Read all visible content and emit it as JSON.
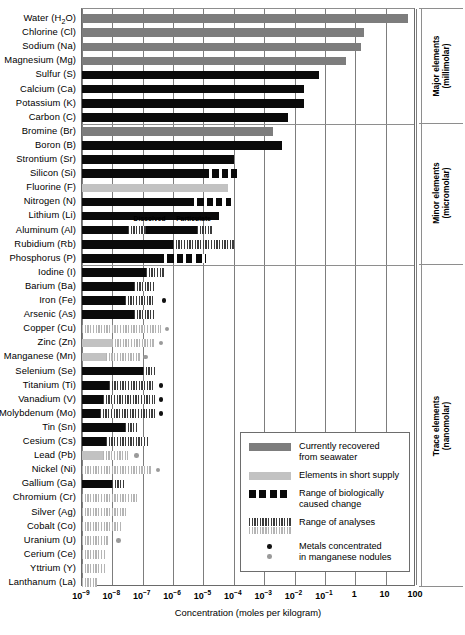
{
  "chart_data": {
    "type": "bar",
    "title": "",
    "xlabel": "Concentration (moles per kilogram)",
    "ylabel": "",
    "xscale": "log",
    "xlim": [
      -9,
      2
    ],
    "xticks": [
      "10⁻⁹",
      "10⁻⁸",
      "10⁻⁷",
      "10⁻⁶",
      "10⁻⁵",
      "10⁻⁴",
      "10⁻³",
      "10⁻²",
      "10⁻¹",
      "1",
      "10",
      "100"
    ],
    "xtick_exponents": [
      -9,
      -8,
      -7,
      -6,
      -5,
      -4,
      -3,
      -2,
      -1,
      0,
      1,
      2
    ],
    "grid": "vertical",
    "legend_position": "inside-lower-right",
    "categories": [
      "Water (H2O)",
      "Chlorine (Cl)",
      "Sodium (Na)",
      "Magnesium (Mg)",
      "Sulfur (S)",
      "Calcium (Ca)",
      "Potassium (K)",
      "Carbon (C)",
      "Bromine (Br)",
      "Boron (B)",
      "Strontium (Sr)",
      "Silicon (Si)",
      "Fluorine (F)",
      "Nitrogen (N)",
      "Lithium (Li)",
      "Aluminum (Al)",
      "Rubidium (Rb)",
      "Phosphorus (P)",
      "Iodine (I)",
      "Barium (Ba)",
      "Iron (Fe)",
      "Arsenic (As)",
      "Copper (Cu)",
      "Zinc (Zn)",
      "Manganese (Mn)",
      "Selenium (Se)",
      "Titanium (Ti)",
      "Vanadium (V)",
      "Molybdenum (Mo)",
      "Tin (Sn)",
      "Cesium (Cs)",
      "Lead (Pb)",
      "Nickel (Ni)",
      "Gallium (Ga)",
      "Chromium (Cr)",
      "Silver (Ag)",
      "Cobalt (Co)",
      "Uranium (U)",
      "Cerium (Ce)",
      "Yttrium (Y)",
      "Lanthanum (La)"
    ],
    "values_log10_max": [
      1.75,
      0.3,
      0.2,
      -0.3,
      -1.2,
      -1.7,
      -1.7,
      -2.2,
      -2.7,
      -2.4,
      -4.0,
      -4.0,
      -4.2,
      -4.1,
      -4.5,
      -4.0,
      -5.9,
      -4.9,
      -6.3,
      -6.6,
      -5.9,
      -6.6,
      -6.2,
      -6.1,
      -6.9,
      -6.0,
      -6.5,
      -6.5,
      -6.4,
      -6.1,
      -6.6,
      -6.3,
      -6.5,
      -7.3,
      -6.8,
      -7.0,
      -7.2,
      -7.5,
      -7.8,
      -7.7,
      -8.0
    ],
    "note_dissolved": "Dissolved",
    "note_particulate": "Particulate"
  },
  "rows": [
    {
      "name": "Water (H₂O)",
      "label_html": "Water (H<sub>2</sub>O)",
      "segments": [
        {
          "style": "gray",
          "from": -9,
          "to": 1.75
        }
      ],
      "dots": []
    },
    {
      "name": "Chlorine (Cl)",
      "label_html": "Chlorine (Cl)",
      "segments": [
        {
          "style": "gray",
          "from": -9,
          "to": 0.3
        }
      ],
      "dots": []
    },
    {
      "name": "Sodium (Na)",
      "label_html": "Sodium (Na)",
      "segments": [
        {
          "style": "gray",
          "from": -9,
          "to": 0.2
        }
      ],
      "dots": []
    },
    {
      "name": "Magnesium (Mg)",
      "label_html": "Magnesium (Mg)",
      "segments": [
        {
          "style": "gray",
          "from": -9,
          "to": -0.3
        }
      ],
      "dots": []
    },
    {
      "name": "Sulfur (S)",
      "label_html": "Sulfur (S)",
      "segments": [
        {
          "style": "dark",
          "from": -9,
          "to": -1.2
        }
      ],
      "dots": []
    },
    {
      "name": "Calcium (Ca)",
      "label_html": "Calcium (Ca)",
      "segments": [
        {
          "style": "dark",
          "from": -9,
          "to": -1.7
        }
      ],
      "dots": []
    },
    {
      "name": "Potassium (K)",
      "label_html": "Potassium (K)",
      "segments": [
        {
          "style": "dark",
          "from": -9,
          "to": -1.7
        }
      ],
      "dots": []
    },
    {
      "name": "Carbon (C)",
      "label_html": "Carbon (C)",
      "segments": [
        {
          "style": "dark",
          "from": -9,
          "to": -2.2
        }
      ],
      "dots": []
    },
    {
      "name": "Bromine (Br)",
      "label_html": "Bromine (Br)",
      "segments": [
        {
          "style": "gray",
          "from": -9,
          "to": -2.7
        }
      ],
      "dots": []
    },
    {
      "name": "Boron (B)",
      "label_html": "Boron (B)",
      "segments": [
        {
          "style": "dark",
          "from": -9,
          "to": -2.4
        }
      ],
      "dots": []
    },
    {
      "name": "Strontium (Sr)",
      "label_html": "Strontium (Sr)",
      "segments": [
        {
          "style": "dark",
          "from": -9,
          "to": -4.0
        }
      ],
      "dots": []
    },
    {
      "name": "Silicon (Si)",
      "label_html": "Silicon (Si)",
      "segments": [
        {
          "style": "dark",
          "from": -9,
          "to": -5.0
        },
        {
          "style": "bio",
          "from": -5.0,
          "to": -3.9
        }
      ],
      "dots": []
    },
    {
      "name": "Fluorine (F)",
      "label_html": "Fluorine (F)",
      "segments": [
        {
          "style": "light",
          "from": -9,
          "to": -4.2
        }
      ],
      "dots": []
    },
    {
      "name": "Nitrogen (N)",
      "label_html": "Nitrogen (N)",
      "segments": [
        {
          "style": "dark",
          "from": -9,
          "to": -5.5
        },
        {
          "style": "bio",
          "from": -5.5,
          "to": -4.1
        }
      ],
      "dots": []
    },
    {
      "name": "Lithium (Li)",
      "label_html": "Lithium (Li)",
      "segments": [
        {
          "style": "dark",
          "from": -9,
          "to": -4.5
        }
      ],
      "dots": []
    },
    {
      "name": "Aluminum (Al)",
      "label_html": "Aluminum (Al)",
      "segments": [
        {
          "style": "dark",
          "from": -9,
          "to": -7.5
        },
        {
          "style": "hatch-dark",
          "from": -7.5,
          "to": -6.9
        },
        {
          "style": "dark",
          "from": -6.9,
          "to": -5.2
        },
        {
          "style": "hatch-dark",
          "from": -5.2,
          "to": -4.7
        }
      ],
      "dots": []
    },
    {
      "name": "Rubidium (Rb)",
      "label_html": "Rubidium (Rb)",
      "segments": [
        {
          "style": "dark",
          "from": -9,
          "to": -6.0
        },
        {
          "style": "hatch-dark",
          "from": -6.0,
          "to": -4.0
        }
      ],
      "dots": []
    },
    {
      "name": "Phosphorus (P)",
      "label_html": "Phosphorus (P)",
      "segments": [
        {
          "style": "dark",
          "from": -9,
          "to": -6.5
        },
        {
          "style": "bio",
          "from": -6.5,
          "to": -4.9
        }
      ],
      "dots": []
    },
    {
      "name": "Iodine (I)",
      "label_html": "Iodine (I)",
      "segments": [
        {
          "style": "dark",
          "from": -9,
          "to": -6.9
        },
        {
          "style": "hatch-dark",
          "from": -6.9,
          "to": -6.3
        }
      ],
      "dots": []
    },
    {
      "name": "Barium (Ba)",
      "label_html": "Barium (Ba)",
      "segments": [
        {
          "style": "dark",
          "from": -9,
          "to": -7.3
        },
        {
          "style": "hatch-dark",
          "from": -7.3,
          "to": -6.6
        }
      ],
      "dots": []
    },
    {
      "name": "Iron (Fe)",
      "label_html": "Iron (Fe)",
      "segments": [
        {
          "style": "dark",
          "from": -9,
          "to": -7.6
        },
        {
          "style": "hatch-dark",
          "from": -7.6,
          "to": -6.6
        }
      ],
      "dots": [
        {
          "style": "dark",
          "at": -6.3
        }
      ]
    },
    {
      "name": "Arsenic (As)",
      "label_html": "Arsenic (As)",
      "segments": [
        {
          "style": "dark",
          "from": -9,
          "to": -7.3
        },
        {
          "style": "hatch-dark",
          "from": -7.3,
          "to": -6.6
        }
      ],
      "dots": []
    },
    {
      "name": "Copper (Cu)",
      "label_html": "Copper (Cu)",
      "segments": [
        {
          "style": "hatch-light",
          "from": -9,
          "to": -6.4
        }
      ],
      "dots": [
        {
          "style": "gray",
          "at": -6.2
        }
      ]
    },
    {
      "name": "Zinc (Zn)",
      "label_html": "Zinc (Zn)",
      "segments": [
        {
          "style": "light",
          "from": -9,
          "to": -8.0
        },
        {
          "style": "hatch-light",
          "from": -8.0,
          "to": -6.6
        }
      ],
      "dots": [
        {
          "style": "gray",
          "at": -6.4
        }
      ]
    },
    {
      "name": "Manganese (Mn)",
      "label_html": "Manganese (Mn)",
      "segments": [
        {
          "style": "light",
          "from": -9,
          "to": -8.2
        },
        {
          "style": "hatch-light",
          "from": -8.2,
          "to": -7.1
        }
      ],
      "dots": [
        {
          "style": "gray",
          "at": -6.9
        }
      ]
    },
    {
      "name": "Selenium (Se)",
      "label_html": "Selenium (Se)",
      "segments": [
        {
          "style": "dark",
          "from": -9,
          "to": -7.0
        },
        {
          "style": "hatch-dark",
          "from": -7.0,
          "to": -6.6
        }
      ],
      "dots": []
    },
    {
      "name": "Titanium (Ti)",
      "label_html": "Titanium (Ti)",
      "segments": [
        {
          "style": "dark",
          "from": -9,
          "to": -8.1
        },
        {
          "style": "hatch-dark",
          "from": -8.1,
          "to": -6.6
        }
      ],
      "dots": [
        {
          "style": "dark",
          "at": -6.4
        }
      ]
    },
    {
      "name": "Vanadium (V)",
      "label_html": "Vanadium (V)",
      "segments": [
        {
          "style": "dark",
          "from": -9,
          "to": -8.3
        },
        {
          "style": "hatch-dark",
          "from": -8.3,
          "to": -6.6
        }
      ],
      "dots": [
        {
          "style": "dark",
          "at": -6.4
        }
      ]
    },
    {
      "name": "Molybdenum (Mo)",
      "label_html": "Molybdenum (Mo)",
      "segments": [
        {
          "style": "dark",
          "from": -9,
          "to": -8.4
        },
        {
          "style": "hatch-dark",
          "from": -8.4,
          "to": -6.6
        }
      ],
      "dots": [
        {
          "style": "dark",
          "at": -6.4
        }
      ]
    },
    {
      "name": "Tin (Sn)",
      "label_html": "Tin (Sn)",
      "segments": [
        {
          "style": "dark",
          "from": -9,
          "to": -7.6
        },
        {
          "style": "hatch-dark",
          "from": -7.6,
          "to": -7.2
        }
      ],
      "dots": []
    },
    {
      "name": "Cesium (Cs)",
      "label_html": "Cesium (Cs)",
      "segments": [
        {
          "style": "dark",
          "from": -9,
          "to": -8.2
        },
        {
          "style": "hatch-dark",
          "from": -8.2,
          "to": -6.8
        }
      ],
      "dots": []
    },
    {
      "name": "Lead (Pb)",
      "label_html": "Lead (Pb)",
      "segments": [
        {
          "style": "light",
          "from": -9,
          "to": -8.3
        },
        {
          "style": "hatch-light",
          "from": -8.3,
          "to": -7.5
        }
      ],
      "dots": [
        {
          "style": "gray",
          "at": -7.2
        }
      ]
    },
    {
      "name": "Nickel (Ni)",
      "label_html": "Nickel (Ni)",
      "segments": [
        {
          "style": "hatch-light",
          "from": -9,
          "to": -6.7
        }
      ],
      "dots": [
        {
          "style": "gray",
          "at": -6.5
        }
      ]
    },
    {
      "name": "Gallium (Ga)",
      "label_html": "Gallium (Ga)",
      "segments": [
        {
          "style": "dark",
          "from": -9,
          "to": -8.0
        },
        {
          "style": "hatch-dark",
          "from": -8.0,
          "to": -7.6
        }
      ],
      "dots": []
    },
    {
      "name": "Chromium (Cr)",
      "label_html": "Chromium (Cr)",
      "segments": [
        {
          "style": "hatch-light",
          "from": -9,
          "to": -7.2
        }
      ],
      "dots": []
    },
    {
      "name": "Silver (Ag)",
      "label_html": "Silver (Ag)",
      "segments": [
        {
          "style": "hatch-light",
          "from": -9,
          "to": -7.5
        }
      ],
      "dots": []
    },
    {
      "name": "Cobalt (Co)",
      "label_html": "Cobalt (Co)",
      "segments": [
        {
          "style": "hatch-light",
          "from": -9,
          "to": -7.7
        }
      ],
      "dots": []
    },
    {
      "name": "Uranium (U)",
      "label_html": "Uranium (U)",
      "segments": [
        {
          "style": "hatch-light",
          "from": -9,
          "to": -8.1
        }
      ],
      "dots": [
        {
          "style": "gray",
          "at": -7.8
        }
      ]
    },
    {
      "name": "Cerium (Ce)",
      "label_html": "Cerium (Ce)",
      "segments": [
        {
          "style": "hatch-light",
          "from": -9,
          "to": -8.2
        }
      ],
      "dots": []
    },
    {
      "name": "Yttrium (Y)",
      "label_html": "Yttrium (Y)",
      "segments": [
        {
          "style": "hatch-light",
          "from": -9,
          "to": -8.25
        }
      ],
      "dots": []
    },
    {
      "name": "Lanthanum (La)",
      "label_html": "Lanthanum (La)",
      "segments": [
        {
          "style": "hatch-light",
          "from": -9,
          "to": -8.5
        }
      ],
      "dots": []
    }
  ],
  "inline_notes": [
    {
      "text": "Dissolved",
      "row": 15,
      "at_log": -7.3
    },
    {
      "text": "Particulate",
      "row": 15,
      "at_log": -5.9
    }
  ],
  "side_categories": [
    {
      "line1": "Major elements",
      "line2": "(millimolar)"
    },
    {
      "line1": "Minor elements",
      "line2": "(micromolar)"
    },
    {
      "line1": "Trace elements",
      "line2": "(nanomolar)"
    }
  ],
  "legend": {
    "items": [
      {
        "swatch": "gray",
        "line1": "Currently recovered",
        "line2": "from seawater"
      },
      {
        "swatch": "light",
        "line1": "Elements in short supply",
        "line2": ""
      },
      {
        "swatch": "bio",
        "line1": "Range of biologically",
        "line2": "caused change"
      },
      {
        "swatch": "hatch-dual",
        "line1": "Range of analyses",
        "line2": ""
      },
      {
        "swatch": "dots",
        "line1": "Metals concentrated",
        "line2": "in manganese nodules"
      }
    ]
  },
  "axis": {
    "title": "Concentration (moles per kilogram)",
    "ticks": [
      {
        "mantissa": "10",
        "exp": "−9",
        "log": -9
      },
      {
        "mantissa": "10",
        "exp": "−8",
        "log": -8
      },
      {
        "mantissa": "10",
        "exp": "−7",
        "log": -7
      },
      {
        "mantissa": "10",
        "exp": "−6",
        "log": -6
      },
      {
        "mantissa": "10",
        "exp": "−5",
        "log": -5
      },
      {
        "mantissa": "10",
        "exp": "−4",
        "log": -4
      },
      {
        "mantissa": "10",
        "exp": "−3",
        "log": -3
      },
      {
        "mantissa": "10",
        "exp": "−2",
        "log": -2
      },
      {
        "mantissa": "10",
        "exp": "−1",
        "log": -1
      },
      {
        "mantissa": "1",
        "exp": "",
        "log": 0
      },
      {
        "mantissa": "10",
        "exp": "",
        "log": 1
      },
      {
        "mantissa": "100",
        "exp": "",
        "log": 2
      }
    ]
  },
  "section_dividers": [
    {
      "after_row": 7
    },
    {
      "after_row": 17
    }
  ],
  "colors": {
    "recovered": "#7d7d7d",
    "short_supply": "#c2c2c2",
    "biological": "#0a0a0a",
    "analyses_dark": "#3b3b3b",
    "analyses_light": "#b4b4b4",
    "frame": "#6a6a6a"
  }
}
